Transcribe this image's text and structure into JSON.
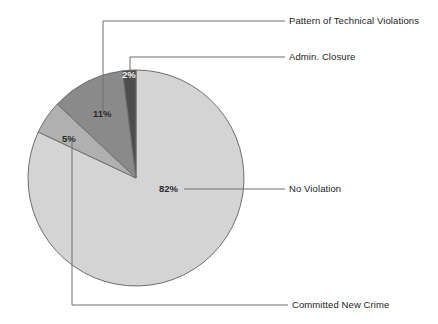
{
  "chart_data": {
    "type": "pie",
    "title": "",
    "subtitle": "",
    "xlabel": "",
    "ylabel": "",
    "legend_position": "callout-labels",
    "grid": false,
    "units": "percent",
    "categories": [
      "Admin. Closure",
      "Pattern of Technical Violations",
      "Committed New Crime",
      "No Violation"
    ],
    "values": [
      2,
      11,
      5,
      82
    ],
    "value_labels": [
      "2%",
      "11%",
      "5%",
      "82%"
    ],
    "colors": [
      "#4d4d4d",
      "#8a8a8a",
      "#b0b0b0",
      "#d4d4d4"
    ],
    "slices": [
      {
        "name": "Admin. Closure",
        "value": 2,
        "value_label": "2%",
        "color": "#4d4d4d",
        "label_on_dark": true
      },
      {
        "name": "Pattern of Technical Violations",
        "value": 11,
        "value_label": "11%",
        "color": "#8a8a8a",
        "label_on_dark": false
      },
      {
        "name": "Committed New Crime",
        "value": 5,
        "value_label": "5%",
        "color": "#b0b0b0",
        "label_on_dark": false
      },
      {
        "name": "No Violation",
        "value": 82,
        "value_label": "82%",
        "color": "#d4d4d4",
        "label_on_dark": false
      }
    ]
  },
  "chart": {
    "stroke_color": "#6e6e6e",
    "leader_color": "#6e6e6e",
    "background": "#ffffff"
  },
  "callouts": {
    "pattern_of_technical_violations": "Pattern of Technical Violations",
    "admin_closure": "Admin. Closure",
    "no_violation": "No Violation",
    "committed_new_crime": "Committed New Crime"
  },
  "slice_values": {
    "admin_closure": "2%",
    "pattern_of_technical_violations": "11%",
    "committed_new_crime": "5%",
    "no_violation": "82%"
  }
}
